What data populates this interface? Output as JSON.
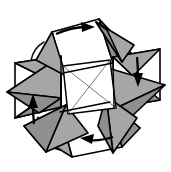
{
  "figure": {
    "title": "Pinwheel of four folded envelope modules with clockwise rotation arrows",
    "caption": "",
    "background_color": "#ffffff",
    "stroke_color": "#000000",
    "fill_gray": "#a6a6a6",
    "fill_gray_dark": "#8f8f8f",
    "fill_white": "#ffffff",
    "diagonal_color": "#6b6b6b",
    "symmetry": "4-fold rotational",
    "rotation_direction": "clockwise",
    "module_count": 4,
    "arrow_count": 4,
    "arc_count": 4
  },
  "center": {
    "name": "central-square",
    "shape": "square",
    "fill": "#ffffff",
    "diagonals": 2,
    "diagonal_style": "thin gray X"
  },
  "modules": [
    {
      "id": "module-top",
      "position": "top",
      "arrow": "right",
      "faces": [
        "white-panel",
        "gray-left-flap",
        "gray-right-flap"
      ]
    },
    {
      "id": "module-right",
      "position": "right",
      "arrow": "down",
      "faces": [
        "white-panel",
        "gray-upper-flap",
        "gray-lower-flap"
      ]
    },
    {
      "id": "module-bottom",
      "position": "bottom",
      "arrow": "left",
      "faces": [
        "white-panel",
        "gray-right-flap",
        "gray-left-flap"
      ]
    },
    {
      "id": "module-left",
      "position": "left",
      "arrow": "up",
      "faces": [
        "white-panel",
        "gray-lower-flap",
        "gray-upper-flap"
      ]
    }
  ],
  "arrows": [
    {
      "id": "arrow-top",
      "direction": "right",
      "label": ""
    },
    {
      "id": "arrow-right",
      "direction": "down",
      "label": ""
    },
    {
      "id": "arrow-bottom",
      "direction": "left",
      "label": ""
    },
    {
      "id": "arrow-left",
      "direction": "up",
      "label": ""
    }
  ],
  "arcs": [
    {
      "id": "arc-top-left",
      "quadrant": "top-left"
    },
    {
      "id": "arc-top-right",
      "quadrant": "top-right"
    },
    {
      "id": "arc-bottom-right",
      "quadrant": "bottom-right"
    },
    {
      "id": "arc-bottom-left",
      "quadrant": "bottom-left"
    }
  ]
}
